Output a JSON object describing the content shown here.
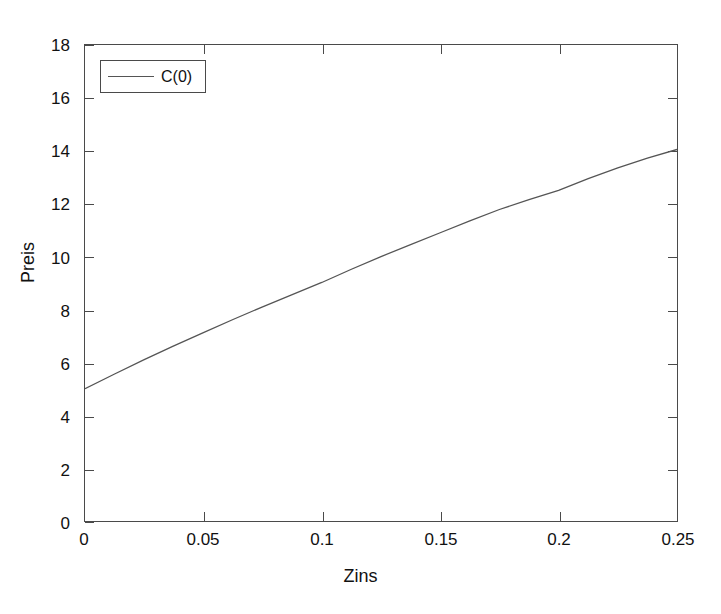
{
  "figure": {
    "background_color": "#ffffff",
    "axis_color": "#4a4a4a",
    "line_color": "#555555"
  },
  "axes": {
    "x_title": "Zins",
    "y_title": "Preis",
    "x_ticks": [
      "0",
      "0.05",
      "0.1",
      "0.15",
      "0.2",
      "0.25"
    ],
    "y_ticks": [
      "0",
      "2",
      "4",
      "6",
      "8",
      "10",
      "12",
      "14",
      "16",
      "18"
    ]
  },
  "legend": {
    "entries": [
      {
        "label": "C(0)",
        "color": "#555555"
      }
    ]
  },
  "chart_data": {
    "type": "line",
    "title": "",
    "xlabel": "Zins",
    "ylabel": "Preis",
    "xlim": [
      0,
      0.25
    ],
    "ylim": [
      0,
      18
    ],
    "xticks": [
      0,
      0.05,
      0.1,
      0.15,
      0.2,
      0.25
    ],
    "yticks": [
      0,
      2,
      4,
      6,
      8,
      10,
      12,
      14,
      16,
      18
    ],
    "grid": false,
    "legend_position": "upper left",
    "series": [
      {
        "name": "C(0)",
        "color": "#555555",
        "x": [
          0,
          0.0125,
          0.025,
          0.0375,
          0.05,
          0.0625,
          0.075,
          0.0875,
          0.1,
          0.1125,
          0.125,
          0.1375,
          0.15,
          0.1625,
          0.175,
          0.1875,
          0.2,
          0.2125,
          0.225,
          0.2375,
          0.25
        ],
        "values": [
          5.0,
          5.56,
          6.1,
          6.62,
          7.12,
          7.62,
          8.1,
          8.56,
          9.02,
          9.52,
          10.0,
          10.45,
          10.9,
          11.35,
          11.78,
          12.15,
          12.5,
          12.95,
          13.35,
          13.72,
          14.05
        ]
      }
    ]
  }
}
